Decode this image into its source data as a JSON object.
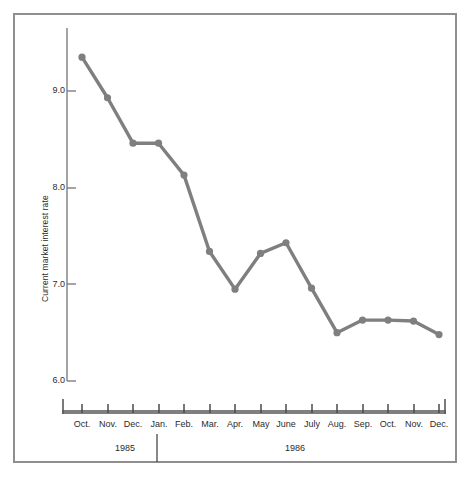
{
  "chart_data": {
    "type": "line",
    "title": "",
    "xlabel": "",
    "ylabel": "Current market interest rate",
    "categories": [
      "Oct.",
      "Nov.",
      "Dec.",
      "Jan.",
      "Feb.",
      "Mar.",
      "Apr.",
      "May",
      "June",
      "July",
      "Aug.",
      "Sep.",
      "Oct.",
      "Nov.",
      "Dec."
    ],
    "values": [
      9.35,
      8.93,
      8.46,
      8.46,
      8.13,
      7.34,
      6.95,
      7.32,
      7.43,
      6.96,
      6.5,
      6.63,
      6.63,
      6.62,
      6.48
    ],
    "ylim": [
      6.0,
      9.5
    ],
    "yticks": [
      "9.0",
      "8.0",
      "7.0",
      "6.0"
    ],
    "ytick_values": [
      9.0,
      8.0,
      7.0,
      6.0
    ],
    "grid": false,
    "legend": "none",
    "series_color": "#7f7f7f",
    "groups": [
      {
        "label": "1985",
        "categories": [
          "Oct.",
          "Nov.",
          "Dec."
        ]
      },
      {
        "label": "1986",
        "categories": [
          "Jan.",
          "Feb.",
          "Mar.",
          "Apr.",
          "May",
          "June",
          "July",
          "Aug.",
          "Sep.",
          "Oct.",
          "Nov.",
          "Dec."
        ]
      }
    ]
  },
  "axis": {
    "y_title": "Current market interest rate",
    "y_tick_labels": [
      "9.0",
      "8.0",
      "7.0",
      "6.0"
    ],
    "x_tick_labels": [
      "Oct.",
      "Nov.",
      "Dec.",
      "Jan.",
      "Feb.",
      "Mar.",
      "Apr.",
      "May",
      "June",
      "July",
      "Aug.",
      "Sep.",
      "Oct.",
      "Nov.",
      "Dec."
    ]
  },
  "groups": {
    "year_1985": "1985",
    "year_1986": "1986"
  },
  "colors": {
    "line": "#7f7f7f",
    "axis": "#7f7f7f",
    "frame": "#8e8e8e",
    "text": "#2b2b2b",
    "background": "#ffffff"
  }
}
